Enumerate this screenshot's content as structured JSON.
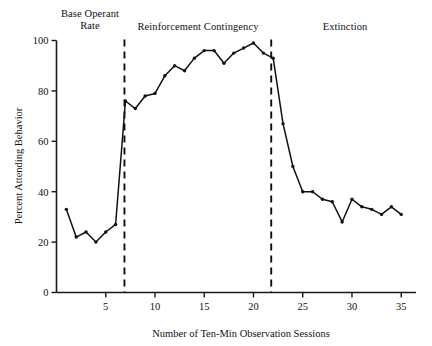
{
  "chart_data": {
    "type": "line",
    "title": "",
    "xlabel": "Number of Ten-Min Observation Sessions",
    "ylabel": "Percent Attending Behavior",
    "xlim": [
      0,
      36.5
    ],
    "ylim": [
      0,
      100
    ],
    "xticks": [
      5,
      10,
      15,
      20,
      25,
      30,
      35
    ],
    "xtick_labels": [
      "5",
      "10",
      "15",
      "20",
      "25",
      "30",
      "35"
    ],
    "yticks": [
      0,
      20,
      40,
      60,
      80,
      100
    ],
    "ytick_labels": [
      "0",
      "20",
      "40",
      "60",
      "80",
      "100"
    ],
    "grid": false,
    "legend": "none",
    "marker": "filled-circle",
    "line_color": "#111111",
    "x": [
      1,
      2,
      3,
      4,
      5,
      6,
      7,
      8,
      9,
      10,
      11,
      12,
      13,
      14,
      15,
      16,
      17,
      18,
      19,
      20,
      21,
      22,
      23,
      24,
      25,
      26,
      27,
      28,
      29,
      30,
      31,
      32,
      33,
      34,
      35
    ],
    "values": [
      33,
      22,
      24,
      20,
      24,
      27,
      76,
      73,
      78,
      79,
      86,
      90,
      88,
      93,
      96,
      96,
      91,
      95,
      97,
      99,
      95,
      93,
      67,
      50,
      40,
      40,
      37,
      36,
      28,
      37,
      34,
      33,
      31,
      34,
      31
    ],
    "series": [
      {
        "name": "Percent attending behavior",
        "values": [
          33,
          22,
          24,
          20,
          24,
          27,
          76,
          73,
          78,
          79,
          86,
          90,
          88,
          93,
          96,
          96,
          91,
          95,
          97,
          99,
          95,
          93,
          67,
          50,
          40,
          40,
          37,
          36,
          28,
          37,
          34,
          33,
          31,
          34,
          31
        ]
      }
    ],
    "annotations": [
      {
        "label": "Base Operant\nRate",
        "phase_start": 1,
        "phase_end": 6.9
      },
      {
        "label": "Reinforcement Contingency",
        "phase_start": 6.9,
        "phase_end": 21.8
      },
      {
        "label": "Extinction",
        "phase_start": 21.8,
        "phase_end": 35
      }
    ],
    "dividers": [
      6.9,
      21.8
    ]
  },
  "phases": [
    {
      "line1": "Base Operant",
      "line2": "Rate"
    },
    {
      "line1": "Reinforcement Contingency",
      "line2": ""
    },
    {
      "line1": "Extinction",
      "line2": ""
    }
  ],
  "axes": {
    "x_title": "Number of Ten-Min Observation Sessions",
    "y_title": "Percent Attending Behavior"
  }
}
